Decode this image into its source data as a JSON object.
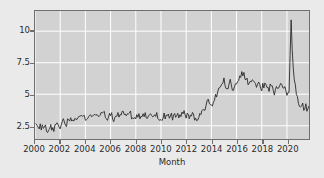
{
  "chart_data": {
    "type": "line",
    "title": "",
    "subtitle": "",
    "xlabel": "Month",
    "ylabel": "",
    "xlim": [
      2000.0,
      2021.75
    ],
    "ylim": [
      1.45,
      11.6
    ],
    "grid": true,
    "legend": null,
    "xticks": [
      2000,
      2002,
      2004,
      2006,
      2008,
      2010,
      2012,
      2014,
      2016,
      2018,
      2020
    ],
    "xtick_labels": [
      "2000",
      "2002",
      "2004",
      "2006",
      "2008",
      "2010",
      "2012",
      "2014",
      "2016",
      "2018",
      "2020"
    ],
    "yticks": [
      2.5,
      5,
      7.5,
      10
    ],
    "ytick_labels": [
      "2.5",
      "5",
      "7.5",
      "10"
    ],
    "line_color": "#2a2a2a",
    "plot_background": "#d2d2d2",
    "figure_background": "#eaeaea",
    "grid_color": "#ffffff",
    "axis_color": "#6f6f6f",
    "series": [
      {
        "name": "Unemployment rate",
        "x": [
          2000.0,
          2000.25,
          2000.5,
          2000.75,
          2001.0,
          2001.25,
          2001.5,
          2001.75,
          2002.0,
          2002.25,
          2002.5,
          2002.75,
          2003.0,
          2003.25,
          2003.5,
          2003.75,
          2004.0,
          2004.25,
          2004.5,
          2004.75,
          2005.0,
          2005.25,
          2005.5,
          2005.75,
          2006.0,
          2006.25,
          2006.5,
          2006.75,
          2007.0,
          2007.25,
          2007.5,
          2007.75,
          2008.0,
          2008.25,
          2008.5,
          2008.75,
          2009.0,
          2009.25,
          2009.5,
          2009.75,
          2010.0,
          2010.25,
          2010.5,
          2010.75,
          2011.0,
          2011.25,
          2011.5,
          2011.75,
          2012.0,
          2012.25,
          2012.5,
          2012.75,
          2013.0,
          2013.25,
          2013.5,
          2013.75,
          2014.0,
          2014.25,
          2014.5,
          2014.75,
          2015.0,
          2015.25,
          2015.5,
          2015.75,
          2016.0,
          2016.25,
          2016.5,
          2016.75,
          2017.0,
          2017.25,
          2017.5,
          2017.75,
          2018.0,
          2018.25,
          2018.5,
          2018.75,
          2019.0,
          2019.25,
          2019.5,
          2019.75,
          2020.0,
          2020.08,
          2020.17,
          2020.25,
          2020.33,
          2020.42,
          2020.5,
          2020.67,
          2020.83,
          2021.0,
          2021.17,
          2021.33,
          2021.5,
          2021.67,
          2021.75
        ],
        "values": [
          2.45,
          2.6,
          2.3,
          2.55,
          2.05,
          2.35,
          2.2,
          2.6,
          2.5,
          2.9,
          2.7,
          3.1,
          2.85,
          3.25,
          3.0,
          3.3,
          2.95,
          3.3,
          3.05,
          3.6,
          3.3,
          3.75,
          3.4,
          3.15,
          3.45,
          3.1,
          3.4,
          3.2,
          3.55,
          3.25,
          3.5,
          3.2,
          3.05,
          3.35,
          3.1,
          3.4,
          3.2,
          3.45,
          3.15,
          3.35,
          3.0,
          3.35,
          3.05,
          3.4,
          3.1,
          3.45,
          3.2,
          3.5,
          3.3,
          3.15,
          3.35,
          3.05,
          3.3,
          3.5,
          3.95,
          4.4,
          4.1,
          4.65,
          5.1,
          5.65,
          6.05,
          5.5,
          5.95,
          5.4,
          5.85,
          6.3,
          6.65,
          6.2,
          5.7,
          6.1,
          5.6,
          6.0,
          5.5,
          5.9,
          5.35,
          5.75,
          5.2,
          5.6,
          6.05,
          5.5,
          5.0,
          5.3,
          4.8,
          4.55,
          4.9,
          4.4,
          4.15,
          4.55,
          4.25,
          3.9,
          4.2,
          3.8,
          4.1,
          3.7,
          3.95
        ],
        "covid_spike_peak": 11.0,
        "covid_spike_month": 2020.33
      }
    ]
  },
  "axes": {
    "xlabel": "Month"
  }
}
